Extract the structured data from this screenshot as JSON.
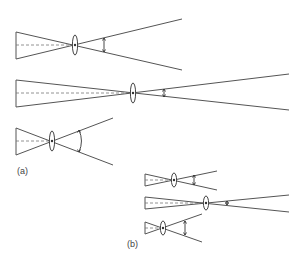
{
  "labels": {
    "a": "(a)",
    "b": "(b)"
  },
  "diagrams": [
    {
      "group": "a",
      "id": "a1",
      "object_x": 16,
      "object_top": 32,
      "object_bottom": 59,
      "lens_x": 75,
      "axis_y": 45,
      "lens_half_h": 10,
      "end_x": 182,
      "end_top": 19,
      "end_bottom": 70,
      "angle_x": 104,
      "angle_top": 38,
      "angle_bottom": 52,
      "arc": false
    },
    {
      "group": "a",
      "id": "a2",
      "object_x": 16,
      "object_top": 80,
      "object_bottom": 107,
      "lens_x": 133,
      "axis_y": 93,
      "lens_half_h": 10,
      "end_x": 289,
      "end_top": 74,
      "end_bottom": 110,
      "angle_x": 164,
      "angle_top": 89,
      "angle_bottom": 97,
      "arc": false
    },
    {
      "group": "a",
      "id": "a3",
      "object_x": 16,
      "object_top": 128,
      "object_bottom": 155,
      "lens_x": 52,
      "axis_y": 141,
      "lens_half_h": 10,
      "end_x": 113,
      "end_top": 118,
      "end_bottom": 165,
      "angle_x": 79,
      "angle_top": 130,
      "angle_bottom": 152,
      "arc": true
    },
    {
      "group": "b",
      "id": "b1",
      "object_x": 145,
      "object_top": 174,
      "object_bottom": 186,
      "lens_x": 174,
      "axis_y": 180,
      "lens_half_h": 7,
      "end_x": 217,
      "end_top": 171,
      "end_bottom": 190,
      "angle_x": 194,
      "angle_top": 175,
      "angle_bottom": 185,
      "arc": false
    },
    {
      "group": "b",
      "id": "b2",
      "object_x": 145,
      "object_top": 197,
      "object_bottom": 209,
      "lens_x": 206,
      "axis_y": 203,
      "lens_half_h": 7,
      "end_x": 289,
      "end_top": 195,
      "end_bottom": 212,
      "angle_x": 227,
      "angle_top": 201,
      "angle_bottom": 205,
      "arc": false
    },
    {
      "group": "b",
      "id": "b3",
      "object_x": 145,
      "object_top": 222,
      "object_bottom": 234,
      "lens_x": 163,
      "axis_y": 228,
      "lens_half_h": 7,
      "end_x": 202,
      "end_top": 214,
      "end_bottom": 242,
      "angle_x": 185,
      "angle_top": 221,
      "angle_bottom": 235,
      "arc": false
    }
  ]
}
